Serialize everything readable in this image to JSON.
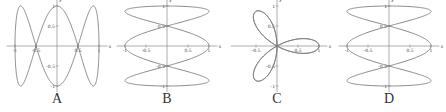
{
  "figure": {
    "panels": [
      {
        "label": "A",
        "left": 2
      },
      {
        "label": "B",
        "left": 112
      },
      {
        "label": "C",
        "left": 222
      },
      {
        "label": "D",
        "left": 334
      }
    ]
  },
  "chart_data": [
    {
      "type": "line",
      "title": "A",
      "kind": "parametric",
      "x_expr": "sin(t)",
      "y_expr": "cos(3t)",
      "xlabel": "x",
      "ylabel": "y",
      "xlim": [
        -1.2,
        1.2
      ],
      "ylim": [
        -1.1,
        1.1
      ],
      "x_ticks": [
        -1,
        -0.5,
        0.5,
        1
      ],
      "y_ticks": [
        1,
        0.5,
        -0.5,
        -1
      ],
      "x_tick_labels": [
        "-1",
        "-0.5",
        "0.5",
        "1"
      ],
      "y_tick_labels": [
        "1",
        "0.5",
        "-0.5",
        "-1"
      ],
      "grid": false,
      "legend": null
    },
    {
      "type": "line",
      "title": "B",
      "kind": "parametric",
      "x_expr": "cos(3t)",
      "y_expr": "sin(t)",
      "xlabel": "x",
      "ylabel": "y",
      "xlim": [
        -1.2,
        1.2
      ],
      "ylim": [
        -1.1,
        1.1
      ],
      "x_ticks": [
        -1,
        -0.5,
        0.5,
        1
      ],
      "y_ticks": [
        1,
        0.5,
        -0.5,
        -1
      ],
      "x_tick_labels": [
        "-1",
        "-0.5",
        "0.5",
        "1"
      ],
      "y_tick_labels": [
        "1",
        "0.5",
        "-0.5",
        "-1"
      ],
      "grid": false,
      "legend": null
    },
    {
      "type": "line",
      "title": "C",
      "kind": "polar",
      "r_expr": "cos(3θ)",
      "xlabel": "x",
      "ylabel": "y",
      "xlim": [
        -1.1,
        1.2
      ],
      "ylim": [
        -1.1,
        1.1
      ],
      "x_ticks": [
        -0.5,
        0.5,
        1
      ],
      "y_ticks": [
        1,
        0.5,
        -0.5,
        -1
      ],
      "x_tick_labels": [
        "-0.5",
        "0.5",
        "1"
      ],
      "y_tick_labels": [
        "1",
        "0.5",
        "-0.5",
        "-1"
      ],
      "grid": false,
      "legend": null
    },
    {
      "type": "line",
      "title": "D",
      "kind": "parametric",
      "x_expr": "sin(3t)",
      "y_expr": "cos(t)",
      "xlabel": "x",
      "ylabel": "y",
      "xlim": [
        -1.2,
        1.2
      ],
      "ylim": [
        -1.1,
        1.1
      ],
      "x_ticks": [
        -1,
        -0.5,
        0.5,
        1
      ],
      "y_ticks": [
        1,
        0.5,
        -0.5,
        -1
      ],
      "x_tick_labels": [
        "-1",
        "-0.5",
        "0.5",
        "1"
      ],
      "y_tick_labels": [
        "1",
        "0.5",
        "-0.5",
        "-1"
      ],
      "grid": false,
      "legend": null
    }
  ],
  "colors": {
    "curve": "#7a7a7a",
    "axis": "#8a8a8a",
    "text": "#444444"
  }
}
